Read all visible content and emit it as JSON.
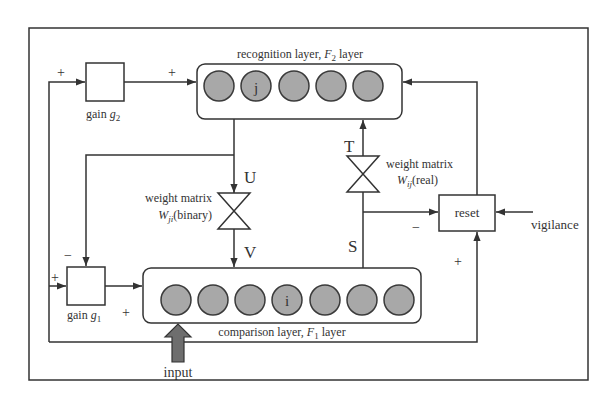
{
  "diagram": {
    "colors": {
      "line": "#333333",
      "node_fill": "#a8a8a8",
      "node_stroke": "#3a3a3a",
      "input_arrow": "#6e6e6e",
      "background": "#ffffff"
    },
    "recognition_layer": {
      "label_prefix": "recognition layer, ",
      "label_var": "F",
      "label_sub": "2",
      "label_suffix": " layer",
      "nodes": [
        "",
        "j",
        "",
        "",
        ""
      ]
    },
    "comparison_layer": {
      "label_prefix": "comparison layer, ",
      "label_var": "F",
      "label_sub": "1",
      "label_suffix": " layer",
      "nodes": [
        "",
        "",
        "",
        "i",
        "",
        "",
        ""
      ]
    },
    "gain2": {
      "label": "gain ",
      "var": "g",
      "sub": "2",
      "input_sign": "+",
      "output_sign": "+"
    },
    "gain1": {
      "label": "gain ",
      "var": "g",
      "sub": "1",
      "top_sign": "−",
      "left_sign": "+",
      "output_sign": "+"
    },
    "weight_bottom_up": {
      "line1": "weight matrix",
      "var": "W",
      "sub": "ji",
      "type": "(binary)",
      "in_label": "U",
      "out_label": "V"
    },
    "weight_top_down": {
      "line1": "weight matrix",
      "var": "W",
      "sub": "ij",
      "type": "(real)",
      "out_label": "T",
      "in_label": "S"
    },
    "reset": {
      "label": "reset",
      "minus_sign": "−",
      "plus_sign": "+"
    },
    "vigilance": {
      "label": "vigilance"
    },
    "input": {
      "label": "input"
    }
  }
}
